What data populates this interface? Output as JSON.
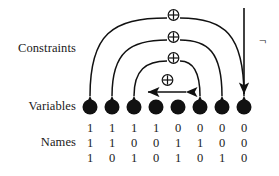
{
  "figure": {
    "background_color": "#ffffff",
    "ink_color": "#111111"
  },
  "labels": {
    "constraints": "Constraints",
    "variables": "Variables",
    "names": "Names"
  },
  "symbols": {
    "xor": "⊕",
    "negation": "¬"
  },
  "chart_data": {
    "type": "diagram",
    "node_count": 8,
    "node_positions_x": [
      90,
      112,
      134,
      156,
      178,
      200,
      222,
      244
    ],
    "node_row_y": 107,
    "node_radius": 7.5,
    "rows": [
      {
        "name": "bit2",
        "values": [
          "1",
          "1",
          "1",
          "1",
          "0",
          "0",
          "0",
          "0"
        ]
      },
      {
        "name": "bit1",
        "values": [
          "1",
          "1",
          "0",
          "0",
          "1",
          "1",
          "0",
          "0"
        ]
      },
      {
        "name": "bit0",
        "values": [
          "1",
          "0",
          "1",
          "0",
          "1",
          "0",
          "1",
          "0"
        ]
      }
    ],
    "constraints": [
      {
        "id": "arc-1",
        "kind": "xor-arc",
        "from_node": 1,
        "to_node": 8,
        "label": "⊕",
        "label_x": 173,
        "label_y": 15,
        "arrowheads": "both"
      },
      {
        "id": "arc-2",
        "kind": "xor-arc",
        "from_node": 2,
        "to_node": 7,
        "label": "⊕",
        "label_x": 173,
        "label_y": 37,
        "arrowheads": "both"
      },
      {
        "id": "arc-3",
        "kind": "xor-arc",
        "from_node": 3,
        "to_node": 6,
        "label": "⊕",
        "label_x": 173,
        "label_y": 58,
        "arrowheads": "both"
      },
      {
        "id": "arc-4",
        "kind": "xor-arc",
        "from_node": 4,
        "to_node": 5,
        "label": "⊕",
        "label_x": 173,
        "label_y": 80,
        "arrowheads": "both"
      },
      {
        "id": "unary-1",
        "kind": "negation-arrow",
        "to_node": 8,
        "label": "¬",
        "label_x": 262,
        "label_y": 40
      }
    ]
  }
}
